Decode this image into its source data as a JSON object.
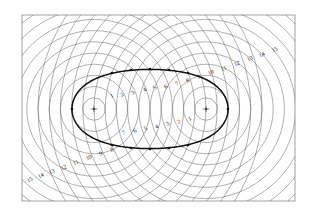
{
  "figure": {
    "background_color": "#ffffff",
    "frame": {
      "stroke_color": "#8a8a8a",
      "x": 22,
      "y": 15,
      "width": 273,
      "height": 186
    },
    "circle_color": "#6e6e6e",
    "oval_color": "#111111",
    "focus_color": "#222222"
  },
  "chart_data": {
    "type": "scatter",
    "xlabel": "",
    "ylabel": "",
    "foci": [
      {
        "name": "left-focus",
        "x": 94,
        "y": 109
      },
      {
        "name": "right-focus",
        "x": 206,
        "y": 109
      }
    ],
    "circle_spacing": 11.2,
    "circle_count": 15,
    "radii": [
      11.2,
      22.4,
      33.6,
      44.8,
      56,
      67.2,
      78.4,
      89.6,
      100.8,
      112,
      123.2,
      134.4,
      145.6,
      156.8,
      168
    ],
    "oval": {
      "name": "cassini-oval",
      "center_x": 150,
      "center_y": 109,
      "semi_major": 78,
      "semi_minor": 45,
      "waist_factor": 0.88
    },
    "node_points": [
      {
        "x": 112,
        "y": 73
      },
      {
        "x": 131,
        "y": 70
      },
      {
        "x": 150,
        "y": 69
      },
      {
        "x": 169,
        "y": 70
      },
      {
        "x": 188,
        "y": 73
      },
      {
        "x": 112,
        "y": 145
      },
      {
        "x": 131,
        "y": 148
      },
      {
        "x": 150,
        "y": 149
      },
      {
        "x": 169,
        "y": 148
      },
      {
        "x": 188,
        "y": 145
      },
      {
        "x": 72,
        "y": 109
      },
      {
        "x": 228,
        "y": 109
      }
    ]
  },
  "labels": {
    "left_upper": {
      "group_name": "left-family-upper-labels",
      "values": [
        "1",
        "2",
        "3",
        "4",
        "5"
      ],
      "positions": [
        {
          "x": 112,
          "y": 96,
          "rot": -28
        },
        {
          "x": 122,
          "y": 95,
          "rot": -30
        },
        {
          "x": 133,
          "y": 93,
          "rot": -32
        },
        {
          "x": 145,
          "y": 90,
          "rot": -36
        },
        {
          "x": 155,
          "y": 88,
          "rot": -40
        }
      ]
    },
    "top_center": {
      "group_name": "top-center-labels",
      "values": [
        "6",
        "7",
        "8"
      ],
      "positions": [
        {
          "x": 166,
          "y": 87,
          "rot": -34
        },
        {
          "x": 177,
          "y": 84,
          "rot": -30
        },
        {
          "x": 188,
          "y": 81,
          "rot": -28
        }
      ]
    },
    "upper_right_diagonal": {
      "group_name": "upper-right-diagonal-labels",
      "values": [
        "9",
        "10",
        "11",
        "12",
        "13",
        "14",
        "15"
      ],
      "positions": [
        {
          "x": 199,
          "y": 77,
          "rot": -26
        },
        {
          "x": 211,
          "y": 73,
          "rot": -26
        },
        {
          "x": 224,
          "y": 69,
          "rot": -26
        },
        {
          "x": 237,
          "y": 64,
          "rot": -26
        },
        {
          "x": 250,
          "y": 59,
          "rot": -26
        },
        {
          "x": 262,
          "y": 55,
          "rot": -26
        },
        {
          "x": 275,
          "y": 50,
          "rot": -26
        }
      ]
    },
    "right_lower": {
      "group_name": "right-family-lower-labels",
      "values": [
        "1",
        "2",
        "3",
        "4"
      ],
      "positions": [
        {
          "x": 190,
          "y": 119,
          "rot": -30
        },
        {
          "x": 179,
          "y": 122,
          "rot": -32
        },
        {
          "x": 168,
          "y": 124,
          "rot": -34
        },
        {
          "x": 157,
          "y": 127,
          "rot": -36
        }
      ]
    },
    "bottom_center": {
      "group_name": "bottom-center-labels",
      "values": [
        "5",
        "6",
        "7"
      ],
      "positions": [
        {
          "x": 146,
          "y": 129,
          "rot": -34
        },
        {
          "x": 135,
          "y": 131,
          "rot": -30
        },
        {
          "x": 124,
          "y": 133,
          "rot": -28
        }
      ]
    },
    "lower_left_diagonal": {
      "group_name": "lower-left-diagonal-labels",
      "values": [
        "8",
        "9",
        "10",
        "11",
        "12",
        "13",
        "14",
        "15"
      ],
      "positions": [
        {
          "x": 112,
          "y": 150,
          "rot": -26
        },
        {
          "x": 101,
          "y": 154,
          "rot": -26
        },
        {
          "x": 89,
          "y": 158,
          "rot": -26
        },
        {
          "x": 76,
          "y": 163,
          "rot": -26
        },
        {
          "x": 64,
          "y": 168,
          "rot": -26
        },
        {
          "x": 52,
          "y": 172,
          "rot": -26
        },
        {
          "x": 41,
          "y": 176,
          "rot": -26
        },
        {
          "x": 30,
          "y": 180,
          "rot": -26
        }
      ]
    }
  }
}
